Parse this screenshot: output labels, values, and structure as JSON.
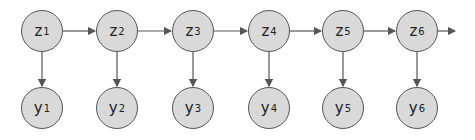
{
  "diagram": {
    "type": "hidden-markov-chain",
    "stroke_color": "#555555",
    "fill_color": "#d9d9d9",
    "hidden_nodes": [
      {
        "base": "z",
        "sub": "1",
        "cx": 42
      },
      {
        "base": "z",
        "sub": "2",
        "cx": 117
      },
      {
        "base": "z",
        "sub": "3",
        "cx": 193
      },
      {
        "base": "z",
        "sub": "4",
        "cx": 269
      },
      {
        "base": "z",
        "sub": "5",
        "cx": 343
      },
      {
        "base": "z",
        "sub": "6",
        "cx": 417
      }
    ],
    "observed_nodes": [
      {
        "base": "y",
        "sub": "1",
        "cx": 42
      },
      {
        "base": "y",
        "sub": "2",
        "cx": 117
      },
      {
        "base": "y",
        "sub": "3",
        "cx": 193
      },
      {
        "base": "y",
        "sub": "4",
        "cx": 269
      },
      {
        "base": "y",
        "sub": "5",
        "cx": 343
      },
      {
        "base": "y",
        "sub": "6",
        "cx": 417
      }
    ],
    "hidden_row_cy": 31,
    "observed_row_cy": 108,
    "radius": 21,
    "trailing_arrow_end_x": 455
  }
}
